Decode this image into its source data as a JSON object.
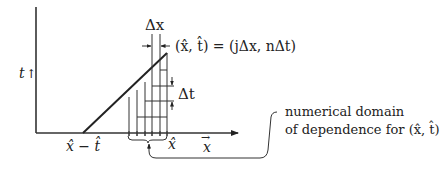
{
  "diagram": {
    "axes": {
      "t_label": "t",
      "t_arrow": "↑",
      "x_label": "x",
      "x_vector_arrow": "→"
    },
    "labels": {
      "delta_x": "Δx",
      "delta_t": "Δt",
      "point_def": "(x̂, t̂) = (jΔx, nΔt)",
      "foot_label": "x̂ − t̂",
      "xhat_label": "x̂",
      "annotation_line1": "numerical domain",
      "annotation_line2": "of dependence for (x̂, t̂)"
    },
    "colors": {
      "ink": "#222222",
      "background": "#ffffff"
    },
    "grid": {
      "vertical_lines_x": [
        129,
        137,
        145,
        152,
        160,
        167
      ],
      "horizontal_lines": [
        {
          "y": 70,
          "x1": 160,
          "x2": 167
        },
        {
          "y": 86,
          "x1": 152,
          "x2": 174
        },
        {
          "y": 101,
          "x1": 145,
          "x2": 174
        },
        {
          "y": 117,
          "x1": 137,
          "x2": 167
        }
      ]
    }
  }
}
